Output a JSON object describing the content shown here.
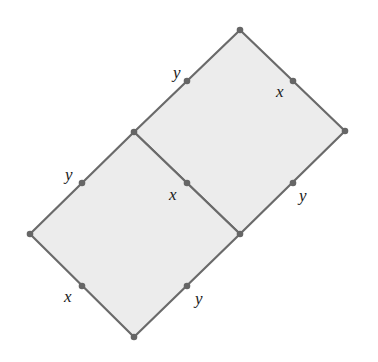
{
  "diagram": {
    "title": "",
    "colors": {
      "fill": "#ececec",
      "stroke": "#6a6a6a",
      "dot": "#666666",
      "label": "#1a1a1a"
    },
    "vertices": {
      "top": [
        240,
        30
      ],
      "right": [
        345,
        131
      ],
      "mid_left": [
        134,
        132
      ],
      "mid_right": [
        240,
        234
      ],
      "left": [
        30,
        234
      ],
      "bottom": [
        134,
        337
      ]
    },
    "shapes": [
      {
        "name": "upper-square",
        "points": [
          "top",
          "right",
          "mid_right",
          "mid_left"
        ]
      },
      {
        "name": "lower-square",
        "points": [
          "mid_left",
          "mid_right",
          "bottom",
          "left"
        ]
      }
    ],
    "edge_marks": [
      {
        "edge": "top-mid_left",
        "dot": [
          187,
          81
        ],
        "label": "y",
        "label_pos": [
          173,
          78
        ]
      },
      {
        "edge": "top-right",
        "dot": [
          293,
          81
        ],
        "label": "x",
        "label_pos": [
          276,
          97
        ]
      },
      {
        "edge": "mid_left-left",
        "dot": [
          82,
          183
        ],
        "label": "y",
        "label_pos": [
          65,
          180
        ]
      },
      {
        "edge": "mid_left-mid_right",
        "dot": [
          187,
          183
        ],
        "label": "x",
        "label_pos": [
          169,
          200
        ]
      },
      {
        "edge": "right-mid_right",
        "dot": [
          293,
          183
        ],
        "label": "y",
        "label_pos": [
          299,
          201
        ]
      },
      {
        "edge": "left-bottom",
        "dot": [
          82,
          286
        ],
        "label": "x",
        "label_pos": [
          64,
          302
        ]
      },
      {
        "edge": "mid_right-bottom",
        "dot": [
          187,
          286
        ],
        "label": "y",
        "label_pos": [
          195,
          304
        ]
      }
    ]
  }
}
